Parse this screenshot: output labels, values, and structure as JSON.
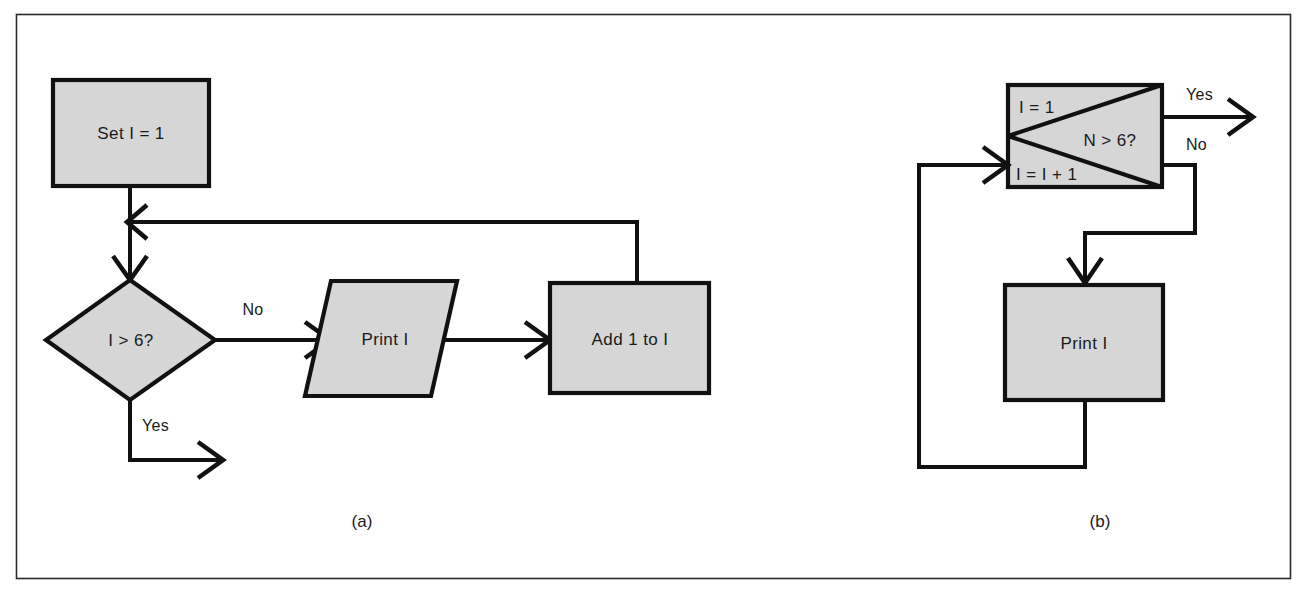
{
  "figure": {
    "background_color": "#ffffff",
    "frame_color": "#2a2a2a",
    "shape_fill": "#d6d6d6",
    "shape_stroke": "#111111",
    "captions": {
      "left": "(a)",
      "right": "(b)"
    }
  },
  "diagram_a": {
    "caption": "(a)",
    "nodes": {
      "start_process": {
        "label": "Set I = 1",
        "shape": "rectangle"
      },
      "decision": {
        "label": "I > 6?",
        "shape": "diamond"
      },
      "output": {
        "label": "Print I",
        "shape": "parallelogram"
      },
      "increment": {
        "label": "Add 1 to I",
        "shape": "rectangle"
      }
    },
    "edge_labels": {
      "decision_no": "No",
      "decision_yes": "Yes"
    }
  },
  "diagram_b": {
    "caption": "(b)",
    "nodes": {
      "loop_box": {
        "shape": "composite-loop-box",
        "init_label": "I = 1",
        "increment_label": "I = I + 1",
        "test_label": "N > 6?"
      },
      "output": {
        "label": "Print I",
        "shape": "rectangle"
      }
    },
    "edge_labels": {
      "test_yes": "Yes",
      "test_no": "No"
    }
  }
}
